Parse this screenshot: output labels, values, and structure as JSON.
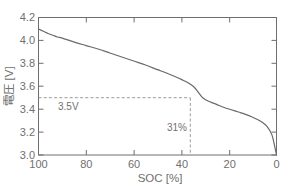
{
  "chart_data": {
    "type": "line",
    "title": "",
    "subtitle": "",
    "xlabel": "SOC [%]",
    "ylabel": "電圧 [V]",
    "xlim": [
      100,
      0
    ],
    "ylim": [
      3.0,
      4.2
    ],
    "x_reversed": true,
    "grid": false,
    "legend": null,
    "xticks": [
      "100",
      "80",
      "60",
      "40",
      "20",
      "0"
    ],
    "xtick_values": [
      100,
      80,
      60,
      40,
      20,
      0
    ],
    "yticks": [
      "3.0",
      "3.2",
      "3.4",
      "3.6",
      "3.8",
      "4.0",
      "4.2"
    ],
    "ytick_values": [
      3.0,
      3.2,
      3.4,
      3.6,
      3.8,
      4.0,
      4.2
    ],
    "series": [
      {
        "name": "discharge-curve",
        "x": [
          100,
          98,
          96,
          94,
          92,
          90,
          85,
          80,
          75,
          70,
          65,
          60,
          55,
          50,
          45,
          40,
          35,
          31,
          28,
          25,
          22,
          19,
          16,
          13,
          10,
          8,
          6,
          4,
          2,
          1,
          0
        ],
        "values": [
          4.1,
          4.08,
          4.06,
          4.045,
          4.03,
          4.02,
          3.985,
          3.955,
          3.925,
          3.89,
          3.855,
          3.82,
          3.785,
          3.745,
          3.705,
          3.66,
          3.6,
          3.5,
          3.465,
          3.44,
          3.415,
          3.395,
          3.375,
          3.355,
          3.33,
          3.31,
          3.285,
          3.25,
          3.18,
          3.1,
          3.0
        ]
      }
    ],
    "annotations": [
      {
        "name": "voltage-threshold",
        "label": "3.5V",
        "type": "hline",
        "value": 3.5,
        "style": "dashed"
      },
      {
        "name": "soc-threshold",
        "label": "31%",
        "type": "vline",
        "value": 31,
        "style": "dashed"
      }
    ],
    "colors": {
      "curve": "#6a6a6a",
      "axis": "#6e6e6e",
      "guide": "#8f8f8f",
      "text": "#707070",
      "background": "#ffffff"
    }
  }
}
